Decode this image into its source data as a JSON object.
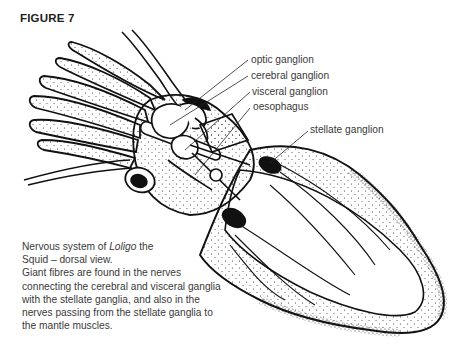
{
  "figure": {
    "title": "FIGURE 7"
  },
  "labels": [
    {
      "id": "optic",
      "text": "optic ganglion"
    },
    {
      "id": "cerebral",
      "text": "cerebral ganglion"
    },
    {
      "id": "visceral",
      "text": "visceral ganglion"
    },
    {
      "id": "oesophagus",
      "text": "oesophagus"
    },
    {
      "id": "stellate",
      "text": "stellate ganglion"
    }
  ],
  "caption": {
    "line1_prefix": "Nervous system of ",
    "line1_italic": "Loligo",
    "line1_suffix": " the",
    "line2": "Squid – dorsal view.",
    "body": "Giant fibres are found in the nerves connecting the cerebral and visceral ganglia with the stellate ganglia, and also in the nerves passing from the stellate ganglia to the mantle muscles."
  },
  "colors": {
    "ink": "#111111",
    "text": "#3a3a3a",
    "background": "#ffffff"
  }
}
